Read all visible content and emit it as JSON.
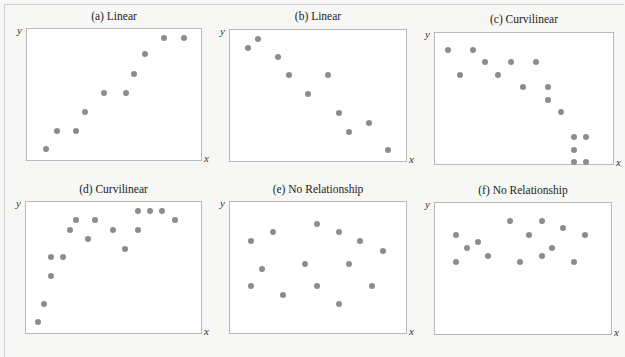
{
  "figure": {
    "panels": [
      {
        "title": "(a) Linear"
      },
      {
        "title": "(b) Linear"
      },
      {
        "title": "(c) Curvilinear"
      },
      {
        "title": "(d) Curvilinear"
      },
      {
        "title": "(e) No Relationship"
      },
      {
        "title": "(f) No Relationship"
      }
    ],
    "xlabel": "x",
    "ylabel": "y"
  },
  "chart_data": [
    {
      "type": "scatter",
      "title": "(a) Linear",
      "xlabel": "x",
      "ylabel": "y",
      "grid": false,
      "x": [
        0.11,
        0.17,
        0.28,
        0.33,
        0.44,
        0.56,
        0.61,
        0.67,
        0.78,
        0.89
      ],
      "y": [
        0.07,
        0.22,
        0.22,
        0.37,
        0.52,
        0.52,
        0.67,
        0.83,
        0.96,
        0.96
      ]
    },
    {
      "type": "scatter",
      "title": "(b) Linear",
      "xlabel": "x",
      "ylabel": "y",
      "grid": false,
      "x": [
        0.1,
        0.16,
        0.27,
        0.33,
        0.44,
        0.55,
        0.61,
        0.67,
        0.78,
        0.89
      ],
      "y": [
        0.89,
        0.96,
        0.82,
        0.67,
        0.52,
        0.67,
        0.37,
        0.22,
        0.29,
        0.07
      ]
    },
    {
      "type": "scatter",
      "title": "(c) Curvilinear",
      "xlabel": "x",
      "ylabel": "y",
      "grid": false,
      "x": [
        0.07,
        0.14,
        0.21,
        0.28,
        0.35,
        0.42,
        0.49,
        0.56,
        0.63,
        0.63,
        0.7,
        0.77,
        0.77,
        0.77,
        0.84,
        0.84
      ],
      "y": [
        0.9,
        0.7,
        0.9,
        0.8,
        0.7,
        0.8,
        0.6,
        0.8,
        0.6,
        0.5,
        0.4,
        0.2,
        0.1,
        -0.0,
        0.2,
        0.0
      ]
    },
    {
      "type": "scatter",
      "title": "(d) Curvilinear",
      "xlabel": "x",
      "ylabel": "y",
      "grid": false,
      "x": [
        0.07,
        0.1,
        0.14,
        0.14,
        0.21,
        0.25,
        0.28,
        0.35,
        0.39,
        0.49,
        0.56,
        0.63,
        0.63,
        0.7,
        0.77,
        0.84
      ],
      "y": [
        0.07,
        0.22,
        0.44,
        0.59,
        0.59,
        0.81,
        0.89,
        0.74,
        0.89,
        0.81,
        0.66,
        0.81,
        0.96,
        0.96,
        0.96,
        0.89
      ]
    },
    {
      "type": "scatter",
      "title": "(e) No Relationship",
      "xlabel": "x",
      "ylabel": "y",
      "grid": false,
      "x": [
        0.12,
        0.12,
        0.18,
        0.24,
        0.3,
        0.42,
        0.49,
        0.49,
        0.61,
        0.61,
        0.67,
        0.73,
        0.8,
        0.86
      ],
      "y": [
        0.72,
        0.36,
        0.5,
        0.79,
        0.29,
        0.54,
        0.86,
        0.36,
        0.79,
        0.22,
        0.54,
        0.72,
        0.36,
        0.64
      ]
    },
    {
      "type": "scatter",
      "title": "(f) No Relationship",
      "xlabel": "x",
      "ylabel": "y",
      "grid": false,
      "x": [
        0.12,
        0.12,
        0.18,
        0.24,
        0.3,
        0.42,
        0.48,
        0.53,
        0.6,
        0.6,
        0.66,
        0.72,
        0.78,
        0.84
      ],
      "y": [
        0.78,
        0.56,
        0.67,
        0.72,
        0.61,
        0.89,
        0.56,
        0.78,
        0.89,
        0.61,
        0.67,
        0.83,
        0.56,
        0.78
      ]
    }
  ]
}
